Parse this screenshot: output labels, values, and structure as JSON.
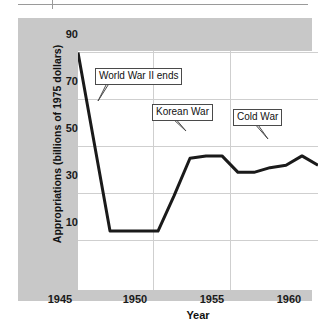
{
  "chart_data": {
    "type": "line",
    "title": "",
    "xlabel": "Year",
    "ylabel": "Appropriations (billions of 1975 dollars)",
    "xlim": [
      1945,
      1960
    ],
    "ylim": [
      0,
      95
    ],
    "xticks": [
      "1945",
      "1950",
      "1955",
      "1960"
    ],
    "yticks": [
      "10",
      "30",
      "50",
      "70",
      "90"
    ],
    "grid": true,
    "legend": null,
    "x": [
      1945,
      1946,
      1947,
      1948,
      1949,
      1950,
      1951,
      1952,
      1953,
      1954,
      1955,
      1956,
      1957,
      1958,
      1959,
      1960
    ],
    "values": [
      90,
      52,
      14,
      14,
      14,
      14,
      29,
      45,
      46,
      46,
      39,
      39,
      41,
      42,
      46,
      42
    ],
    "series": [
      {
        "name": "Appropriations",
        "values": [
          90,
          52,
          14,
          14,
          14,
          14,
          29,
          45,
          46,
          46,
          39,
          39,
          41,
          42,
          46,
          42
        ]
      }
    ],
    "annotations": [
      {
        "label": "World War II ends",
        "points_to_x": 1946.2,
        "points_to_y": 68
      },
      {
        "label": "Korean War",
        "points_to_x": 1952.0,
        "points_to_y": 44
      },
      {
        "label": "Cold War",
        "points_to_x": 1959.0,
        "points_to_y": 46
      }
    ]
  },
  "axis": {
    "y_title": "Appropriations (billions of 1975 dollars)",
    "x_title": "Year",
    "y_ticks": [
      "90",
      "70",
      "50",
      "30",
      "10"
    ],
    "x_ticks": [
      "1945",
      "1950",
      "1955",
      "1960"
    ]
  },
  "annotations": {
    "ww2": "World War II ends",
    "korea": "Korean War",
    "cold": "Cold War"
  },
  "colors": {
    "panel": "#c8c8c8",
    "plot_background": "#ffffff",
    "line": "#1a1a1a",
    "grid": "#cfcfcf",
    "text": "#111111"
  }
}
